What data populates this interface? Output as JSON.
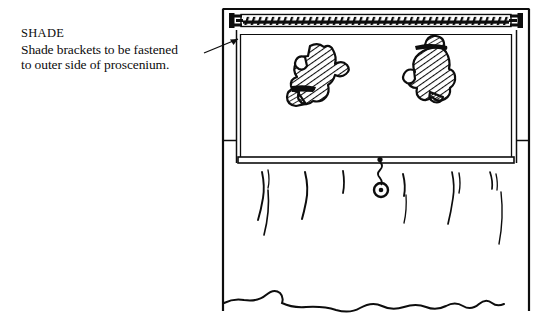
{
  "document": {
    "type": "line-drawing-illustration",
    "background_color": "#ffffff",
    "ink_color": "#0d0d0d"
  },
  "annotation": {
    "heading": "SHADE",
    "line_1": "Shade brackets to be fastened",
    "line_2": "to outer side of proscenium.",
    "leader_line": {
      "from_x": 205,
      "from_y": 52,
      "to_x": 239,
      "to_y": 38,
      "arrowhead": "pointing-up-right-to-left-bracket"
    }
  },
  "drawing": {
    "title": "Puppet theatre proscenium with roller shade",
    "frame": {
      "outer_left": 222,
      "outer_right": 530,
      "outer_top": 9,
      "inner_left": 236,
      "inner_right": 516,
      "label": "proscenium-frame"
    },
    "roller": {
      "left": 240,
      "right": 512,
      "top": 14,
      "bottom": 27,
      "texture": "dense-hatching",
      "label": "shade-roller"
    },
    "brackets": [
      {
        "side": "left",
        "x": 233,
        "y": 20,
        "label": "shade-bracket-left"
      },
      {
        "side": "right",
        "x": 515,
        "y": 20,
        "label": "shade-bracket-right"
      }
    ],
    "shade_panel": {
      "left": 240,
      "right": 512,
      "top": 36,
      "bottom": 157,
      "label": "shade-panel"
    },
    "hem_bar": {
      "left": 238,
      "right": 514,
      "top": 157,
      "bottom": 163,
      "label": "shade-hem-bar"
    },
    "pull_cord": {
      "top_x": 380,
      "top_y": 160,
      "ring_x": 381,
      "ring_y": 190,
      "ring_radius": 7,
      "label": "shade-pull-ring"
    },
    "figures": [
      {
        "name": "hatched-figure-left",
        "x": 288,
        "y": 44,
        "width": 58,
        "height": 62,
        "description": "hatched sketch of a seated character"
      },
      {
        "name": "hatched-figure-right",
        "x": 404,
        "y": 38,
        "width": 56,
        "height": 64,
        "description": "hatched sketch of a character wearing a hat"
      }
    ],
    "curtain": {
      "top": 163,
      "bottom_wave_y": 300,
      "fold_count": 9,
      "label": "stage-curtain"
    }
  }
}
